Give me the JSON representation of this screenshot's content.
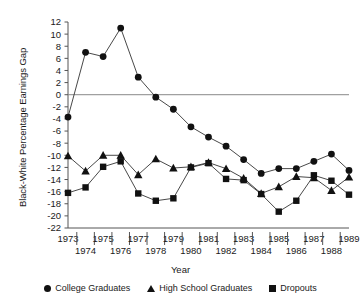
{
  "chart_data": {
    "type": "line",
    "title": "",
    "xlabel": "Year",
    "ylabel": "Black-White Percentage Earnings Gap",
    "x": [
      1973,
      1974,
      1975,
      1976,
      1977,
      1978,
      1979,
      1980,
      1981,
      1982,
      1983,
      1984,
      1985,
      1986,
      1987,
      1988,
      1989
    ],
    "categories": [
      "1973",
      "1974",
      "1975",
      "1976",
      "1977",
      "1978",
      "1979",
      "1980",
      "1981",
      "1982",
      "1983",
      "1984",
      "1985",
      "1986",
      "1987",
      "1988",
      "1989"
    ],
    "xlim": [
      1973,
      1989
    ],
    "ylim": [
      -22,
      12
    ],
    "ytick_step": 2,
    "yticks": [
      12,
      10,
      8,
      6,
      4,
      2,
      0,
      -2,
      -4,
      -6,
      -8,
      -10,
      -12,
      -14,
      -16,
      -18,
      -20,
      -22
    ],
    "ytick_labels": [
      "12",
      "10",
      "8",
      "6",
      "4",
      "2",
      "0",
      "-2",
      "-4",
      "-6",
      "-8",
      "-10",
      "-12",
      "-14",
      "-16",
      "-18",
      "-20",
      "-22"
    ],
    "grid": false,
    "zero_line": true,
    "legend_position": "bottom",
    "series": [
      {
        "name": "College Graduates",
        "marker": "circle",
        "values": [
          -3.7,
          7.0,
          6.3,
          11.0,
          2.9,
          -0.4,
          -2.4,
          -5.3,
          -7.0,
          -8.5,
          -10.7,
          -13.0,
          -12.2,
          -12.2,
          -11.0,
          -9.8,
          -12.5
        ]
      },
      {
        "name": "High School Graduates",
        "marker": "triangle",
        "values": [
          -10.1,
          -12.6,
          -10.0,
          -10.0,
          -13.2,
          -10.6,
          -12.1,
          -11.9,
          -11.2,
          -12.2,
          -13.8,
          -16.3,
          -15.2,
          -13.5,
          -13.7,
          -15.8,
          -13.6
        ]
      },
      {
        "name": "Dropouts",
        "marker": "square",
        "values": [
          -16.2,
          -15.3,
          -11.9,
          -11.0,
          -16.3,
          -17.5,
          -17.1,
          -12.0,
          -11.3,
          -13.9,
          -14.1,
          -16.4,
          -19.3,
          -17.5,
          -13.3,
          -14.2,
          -16.5
        ]
      }
    ]
  },
  "legend": {
    "items": [
      {
        "label": "College Graduates",
        "marker": "circle"
      },
      {
        "label": "High School Graduates",
        "marker": "triangle"
      },
      {
        "label": "Dropouts",
        "marker": "square"
      }
    ]
  },
  "axes": {
    "x_title": "Year",
    "y_title": "Black-White Percentage Earnings Gap"
  }
}
